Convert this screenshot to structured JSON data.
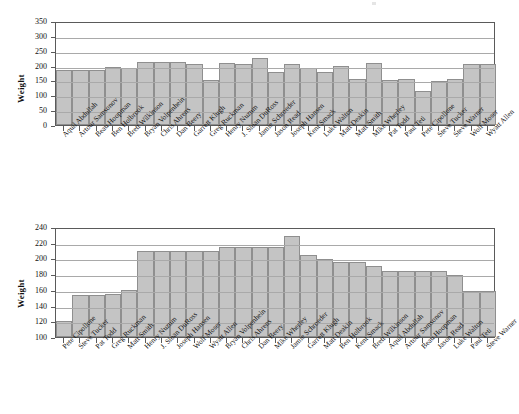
{
  "chart_data": [
    {
      "type": "bar",
      "id": "weight-by-name",
      "title": "",
      "xlabel": "",
      "ylabel": "Weight",
      "ylim": [
        0,
        350
      ],
      "ytick_values": [
        0,
        50,
        100,
        150,
        200,
        250,
        300,
        350
      ],
      "ytick_labels": [
        "0",
        "50",
        "100",
        "150",
        "200",
        "250",
        "300",
        "350"
      ],
      "grid": true,
      "legend": "none",
      "sort": "alphabetical-by-name",
      "categories": [
        "Aquil Abdullah",
        "Artour Samsonov",
        "Beau Hoopman",
        "Ben Holbrook",
        "Brett Wilkinson",
        "Bryan Volpenhein",
        "Chris Ahrens",
        "Dan Beery",
        "Garrett Klugh",
        "Greg Ruckman",
        "Henry Nuzum",
        "J. Sloan DuRoss",
        "Jamie Schroeder",
        "Jason Read",
        "Joseph Hansen",
        "Kent Smack",
        "Luke Walton",
        "Matt Deakin",
        "Matt Smith",
        "Mike Wherley",
        "Pat Todd",
        "Paul Teti",
        "Pete Cipollone",
        "Steve Tucker",
        "Steve Warner",
        "Wolf Moser",
        "Wyatt Allen"
      ],
      "values": [
        184,
        184,
        184,
        194,
        191,
        213,
        213,
        213,
        204,
        153,
        209,
        207,
        225,
        179,
        207,
        192,
        177,
        198,
        156,
        210,
        150,
        155,
        115,
        148,
        156,
        204,
        204
      ]
    },
    {
      "type": "bar",
      "id": "weight-sorted-ascending",
      "title": "",
      "xlabel": "",
      "ylabel": "Weight",
      "ylim": [
        100,
        240
      ],
      "ytick_values": [
        100,
        120,
        140,
        160,
        180,
        200,
        220,
        240
      ],
      "ytick_labels": [
        "100",
        "120",
        "140",
        "160",
        "180",
        "200",
        "220",
        "240"
      ],
      "grid": true,
      "legend": "none",
      "sort": "ascending-by-weight",
      "categories": [
        "Pete Cipollone",
        "Steve Tucker",
        "Pat Todd",
        "Greg Ruckman",
        "Matt Smith",
        "Henry Nuzum",
        "J. Sloan DuRoss",
        "Joseph Hansen",
        "Wolf Moser",
        "Wyatt Allen",
        "Bryan Volpenhein",
        "Chris Ahrens",
        "Dan Beery",
        "Mike Wherley",
        "Jamie Schroeder",
        "Garrett Klugh",
        "Matt Deakin",
        "Ben Holbrook",
        "Kent Smack",
        "Brett Wilkinson",
        "Aquil Abdullah",
        "Artour Samsonov",
        "Beau Hoopman",
        "Jason Read",
        "Luke Walton",
        "Paul Teti",
        "Steve Warner"
      ],
      "values": [
        120,
        153,
        153,
        155,
        160,
        210,
        210,
        210,
        210,
        210,
        215,
        215,
        215,
        215,
        228,
        205,
        199,
        195,
        195,
        190,
        184,
        184,
        184,
        184,
        179,
        159,
        159
      ]
    }
  ]
}
